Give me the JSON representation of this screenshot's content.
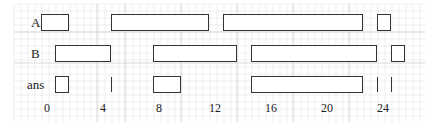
{
  "diagram": {
    "scale": {
      "x0_px": 41,
      "px_per_unit": 14
    },
    "rows": [
      {
        "label": "A",
        "y": 14,
        "h": 17,
        "intervals": [
          [
            0,
            2
          ],
          [
            5,
            12
          ],
          [
            13,
            23
          ],
          [
            24,
            25
          ]
        ]
      },
      {
        "label": "B",
        "y": 45,
        "h": 17,
        "intervals": [
          [
            1,
            5
          ],
          [
            8,
            14
          ],
          [
            15,
            24
          ],
          [
            25,
            26
          ]
        ]
      },
      {
        "label": "ans",
        "y": 76,
        "h": 17,
        "intervals": [
          [
            1,
            2
          ],
          [
            5,
            5
          ],
          [
            8,
            10
          ],
          [
            15,
            23
          ],
          [
            24,
            24
          ],
          [
            25,
            25
          ]
        ]
      }
    ],
    "ticks": [
      "0",
      "4",
      "8",
      "12",
      "16",
      "20",
      "24"
    ],
    "tick_values": [
      0,
      4,
      8,
      12,
      16,
      20,
      24
    ],
    "colors": {
      "line": "#333333",
      "grid_minor": "#e6e6e6",
      "grid_major": "#cfcfcf"
    }
  }
}
